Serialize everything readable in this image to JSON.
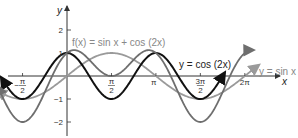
{
  "chart_data": {
    "type": "line",
    "title": "",
    "xlabel": "x",
    "ylabel": "y",
    "xlim": [
      -2.5,
      6.8
    ],
    "ylim": [
      -2.5,
      2.6
    ],
    "grid": false,
    "x_ticks": [
      {
        "value": -1.5708,
        "label_num": "π",
        "label_den": "2",
        "sign": "−"
      },
      {
        "value": 1.5708,
        "label_num": "π",
        "label_den": "2",
        "sign": ""
      },
      {
        "value": 3.1416,
        "label": "π"
      },
      {
        "value": 4.7124,
        "label_num": "3π",
        "label_den": "2",
        "sign": ""
      },
      {
        "value": 6.2832,
        "label": "2π"
      }
    ],
    "y_ticks": [
      {
        "value": 2,
        "label": "2"
      },
      {
        "value": 1,
        "label": "1"
      },
      {
        "value": -1,
        "label": "−1"
      },
      {
        "value": -2,
        "label": "−2"
      }
    ],
    "series": [
      {
        "name": "y = sin x",
        "expr": "sin(x)",
        "color": "#9a9a9a",
        "domain": [
          -2.45,
          6.75
        ]
      },
      {
        "name": "y = cos (2x)",
        "expr": "cos(2x)",
        "color": "#111111",
        "domain": [
          -2.3,
          5.55
        ]
      },
      {
        "name": "f(x) = sin x + cos (2x)",
        "expr": "sin(x)+cos(2x)",
        "color": "#6e6e6e",
        "domain": [
          -2.45,
          6.55
        ]
      }
    ],
    "annotations": [
      {
        "text": "f(x) = sin x + cos (2x)",
        "series": 2
      },
      {
        "text": "y = cos (2x)",
        "series": 1
      },
      {
        "text": "y = sin x",
        "series": 0
      }
    ]
  },
  "labels": {
    "y_axis": "y",
    "x_axis": "x",
    "f_label": "f(x) = sin x + cos (2x)",
    "cos_label": "y = cos (2x)",
    "sin_label": "y = sin x"
  }
}
